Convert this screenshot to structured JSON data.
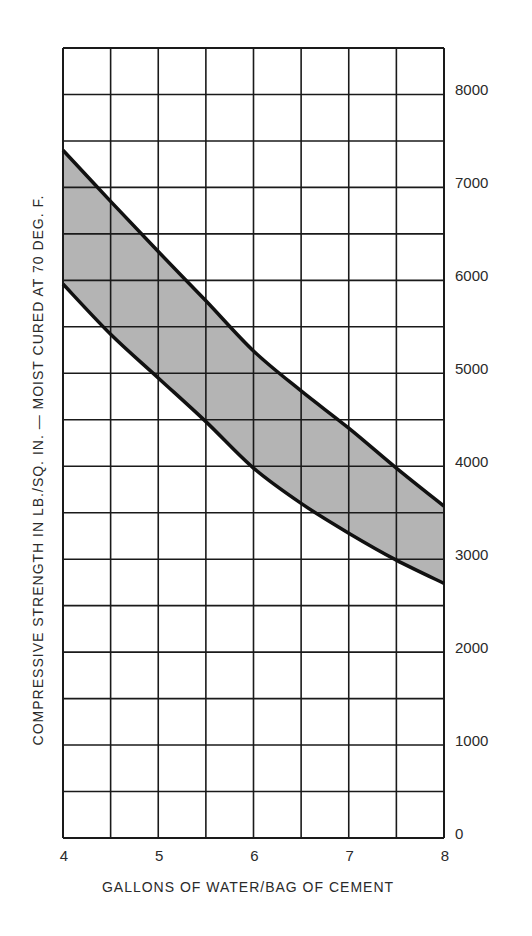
{
  "chart_data": {
    "type": "area",
    "title": "",
    "xlabel": "GALLONS OF WATER/BAG OF CEMENT",
    "ylabel": "COMPRESSIVE STRENGTH IN LB./SQ. IN. — MOIST CURED AT 70 DEG. F.",
    "xlim": [
      4,
      8
    ],
    "ylim": [
      0,
      8500
    ],
    "x_ticks": [
      4,
      5,
      6,
      7,
      8
    ],
    "x_tick_labels": [
      "4",
      "5",
      "6",
      "7",
      "8"
    ],
    "y_ticks": [
      0,
      1000,
      2000,
      3000,
      4000,
      5000,
      6000,
      7000,
      8000
    ],
    "y_tick_labels": [
      "0",
      "1000",
      "2000",
      "3000",
      "4000",
      "5000",
      "6000",
      "7000",
      "8000"
    ],
    "y_axis_position": "right",
    "grid": true,
    "grid_x_step": 0.5,
    "grid_y_step": 500,
    "legend": null,
    "x": [
      4,
      4.5,
      5,
      5.5,
      6,
      6.5,
      7,
      7.5,
      8
    ],
    "series": [
      {
        "name": "Upper bound",
        "values": [
          7400,
          6850,
          6310,
          5780,
          5240,
          4810,
          4410,
          3980,
          3570
        ]
      },
      {
        "name": "Lower bound",
        "values": [
          5960,
          5420,
          4950,
          4480,
          3980,
          3600,
          3280,
          2990,
          2740
        ]
      }
    ],
    "band_fill": "#b4b4b4",
    "line_color": "#111111"
  }
}
